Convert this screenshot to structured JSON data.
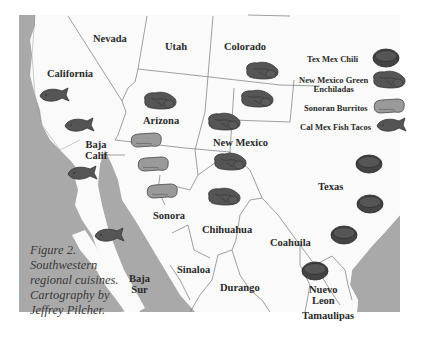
{
  "figure": {
    "caption_lines": [
      "Figure 2.",
      "Southwestern",
      "regional cuisines.",
      "Cartography by",
      "Jeffrey Pilcher."
    ]
  },
  "regions": {
    "nevada": "Nevada",
    "utah": "Utah",
    "colorado": "Colorado",
    "california": "California",
    "arizona": "Arizona",
    "new_mexico": "New Mexico",
    "baja_calif": [
      "Baja",
      "Calif"
    ],
    "texas": "Texas",
    "sonora": "Sonora",
    "chihuahua": "Chihuahua",
    "coahuila": "Coahuila",
    "sinaloa": "Sinaloa",
    "durango": "Durango",
    "baja_sur": [
      "Baja",
      "Sur"
    ],
    "nuevo_leon": [
      "Nuevo",
      "Leon"
    ],
    "tamaulipas": "Tamaulipas"
  },
  "legend": {
    "items": [
      {
        "label": "Tex Mex Chili",
        "icon": "chili-bowl-icon"
      },
      {
        "label": "New Mexico Green\nEnchiladas",
        "label_line1": "New Mexico Green",
        "label_line2": "Enchiladas",
        "icon": "enchilada-icon"
      },
      {
        "label": "Sonoran Burritos",
        "icon": "burrito-icon"
      },
      {
        "label": "Cal Mex Fish Tacos",
        "icon": "fish-icon"
      }
    ]
  },
  "colors": {
    "water": "#a9a9a9",
    "land": "#fafafa",
    "border": "#777777",
    "dark_food": "#555555",
    "light_food": "#9a9a9a"
  }
}
